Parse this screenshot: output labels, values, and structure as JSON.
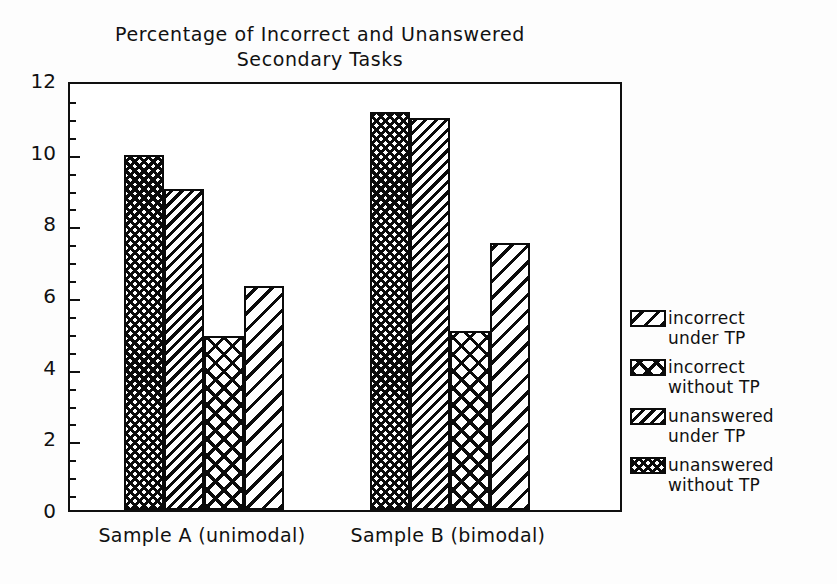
{
  "chart_data": {
    "type": "bar",
    "title": "Percentage of Incorrect and Unanswered\nSecondary Tasks",
    "xlabel": "",
    "ylabel": "",
    "ylim": [
      0,
      12
    ],
    "y_major_ticks": [
      0,
      2,
      4,
      6,
      8,
      10,
      12
    ],
    "y_minor_tick_step": 0.5,
    "grid": false,
    "legend_position": "right",
    "categories": [
      "Sample A (unimodal)",
      "Sample B (bimodal)"
    ],
    "series": [
      {
        "name": "incorrect under TP",
        "label": "incorrect\nunder TP",
        "pattern": "diagonal-wide",
        "values": [
          6.25,
          7.45
        ]
      },
      {
        "name": "incorrect without TP",
        "label": "incorrect\nwithout TP",
        "pattern": "cross-wide",
        "values": [
          4.85,
          5.0
        ]
      },
      {
        "name": "unanswered under TP",
        "label": "unanswered\nunder TP",
        "pattern": "diagonal-dense",
        "values": [
          8.95,
          10.95
        ]
      },
      {
        "name": "unanswered without TP",
        "label": "unanswered\nwithout TP",
        "pattern": "cross-dense",
        "values": [
          9.9,
          11.1
        ]
      }
    ],
    "bar_draw_order": [
      {
        "series": 3,
        "pattern": "cross-dense"
      },
      {
        "series": 2,
        "pattern": "diagonal-dense"
      },
      {
        "series": 1,
        "pattern": "cross-wide"
      },
      {
        "series": 0,
        "pattern": "diagonal-wide"
      }
    ]
  },
  "axis": {
    "y_tick_labels": [
      "12",
      "10",
      "8",
      "6",
      "4",
      "2",
      "0"
    ]
  },
  "colors": {
    "ink": "#0b0b0b",
    "background": "#ffffff"
  }
}
